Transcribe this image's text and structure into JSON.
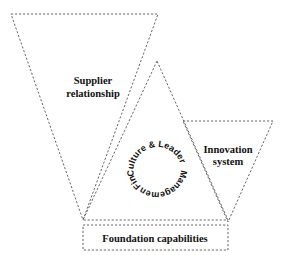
{
  "diagram": {
    "shapes": {
      "supplier_triangle": {
        "points": "11,14 158,14 83,220"
      },
      "center_triangle": {
        "points": "157,61 83,220 228,220"
      },
      "innovation_triangle": {
        "points": "183,121 273,121 228,222"
      },
      "foundation_box": {
        "x": 83,
        "y": 225,
        "width": 145,
        "height": 25
      }
    },
    "labels": {
      "supplier_line1": "Supplier",
      "supplier_line2": "relationship",
      "innovation_line1": "Innovation",
      "innovation_line2": "system",
      "foundation": "Foundation capabilities"
    },
    "ring": {
      "center": [
        157,
        168
      ],
      "radius": 24,
      "culture_leadership": "Culture & Leadership",
      "management": "Management",
      "finance": "Finance"
    }
  }
}
